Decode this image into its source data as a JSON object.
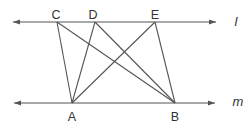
{
  "diagram": {
    "width": 244,
    "height": 127,
    "background": "#ffffff",
    "stroke_color": "#555555",
    "label_color": "#333333",
    "lines": [
      {
        "id": "l",
        "label": "l",
        "y": 22,
        "x1": 13,
        "x2": 216,
        "label_x": 236,
        "label_y": 26
      },
      {
        "id": "m",
        "label": "m",
        "y": 103,
        "x1": 14,
        "x2": 215,
        "label_x": 238,
        "label_y": 106
      }
    ],
    "points": [
      {
        "id": "C",
        "label": "C",
        "x": 57,
        "y": 22,
        "label_x": 56,
        "label_y": 19
      },
      {
        "id": "D",
        "label": "D",
        "x": 95,
        "y": 22,
        "label_x": 93,
        "label_y": 19
      },
      {
        "id": "E",
        "label": "E",
        "x": 155,
        "y": 22,
        "label_x": 155,
        "label_y": 19
      },
      {
        "id": "A",
        "label": "A",
        "x": 72,
        "y": 103,
        "label_x": 72,
        "label_y": 121
      },
      {
        "id": "B",
        "label": "B",
        "x": 175,
        "y": 103,
        "label_x": 175,
        "label_y": 121
      }
    ],
    "segments": [
      {
        "from": "C",
        "to": "A"
      },
      {
        "from": "C",
        "to": "B"
      },
      {
        "from": "D",
        "to": "A"
      },
      {
        "from": "D",
        "to": "B"
      },
      {
        "from": "E",
        "to": "A"
      },
      {
        "from": "E",
        "to": "B"
      }
    ]
  }
}
